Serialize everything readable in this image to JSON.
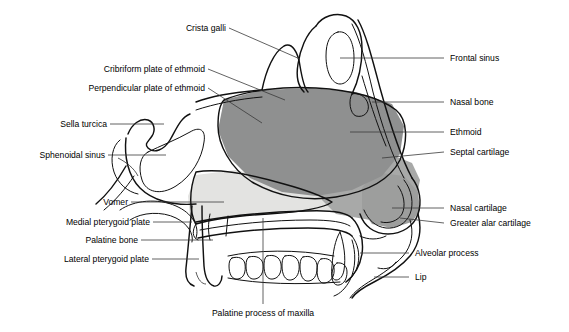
{
  "figure": {
    "type": "anatomical-diagram",
    "background_color": "#ffffff",
    "line_color": "#111111",
    "leader_color": "#3a3a3a"
  },
  "regions": {
    "ethmoid_fill": "#8f9090",
    "septal_cartilage_fill": "#a8a9a8",
    "vomer_fill": "#e3e3e1",
    "bone_fill": "#ffffff"
  },
  "labels_left": [
    {
      "id": "crista-galli",
      "text": "Crista galli"
    },
    {
      "id": "cribriform-plate-of-ethmoid",
      "text": "Cribriform plate of ethmoid"
    },
    {
      "id": "perpendicular-plate-of-ethmoid",
      "text": "Perpendicular plate of ethmoid"
    },
    {
      "id": "sella-turcica",
      "text": "Sella turcica"
    },
    {
      "id": "sphenoidal-sinus",
      "text": "Sphenoidal sinus"
    },
    {
      "id": "vomer",
      "text": "Vomer"
    },
    {
      "id": "medial-pterygoid-plate",
      "text": "Medial pterygoid plate"
    },
    {
      "id": "palatine-bone",
      "text": "Palatine bone"
    },
    {
      "id": "lateral-pterygoid-plate",
      "text": "Lateral pterygoid plate"
    }
  ],
  "labels_right": [
    {
      "id": "frontal-sinus",
      "text": "Frontal sinus"
    },
    {
      "id": "nasal-bone",
      "text": "Nasal bone"
    },
    {
      "id": "ethmoid",
      "text": "Ethmoid"
    },
    {
      "id": "septal-cartilage",
      "text": "Septal cartilage"
    },
    {
      "id": "nasal-cartilage",
      "text": "Nasal cartilage"
    },
    {
      "id": "greater-alar-cartilage",
      "text": "Greater alar cartilage"
    },
    {
      "id": "alveolar-process",
      "text": "Alveolar process"
    },
    {
      "id": "lip",
      "text": "Lip"
    }
  ],
  "labels_bottom": [
    {
      "id": "palatine-process-of-maxilla",
      "text": "Palatine process of maxilla"
    }
  ]
}
